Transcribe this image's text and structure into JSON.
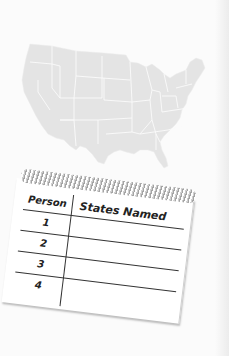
{
  "notepad": {
    "headers": {
      "person": "Person",
      "states_named": "States Named"
    },
    "rows": [
      {
        "person": "1",
        "states_named": ""
      },
      {
        "person": "2",
        "states_named": ""
      },
      {
        "person": "3",
        "states_named": ""
      },
      {
        "person": "4",
        "states_named": ""
      }
    ]
  },
  "map": {
    "subject": "Contiguous United States",
    "fill_color": "#e4e4e4",
    "border_color": "#ffffff"
  },
  "colors": {
    "background": "#fbfbfb",
    "paper": "#ffffff",
    "ink": "#222222"
  }
}
